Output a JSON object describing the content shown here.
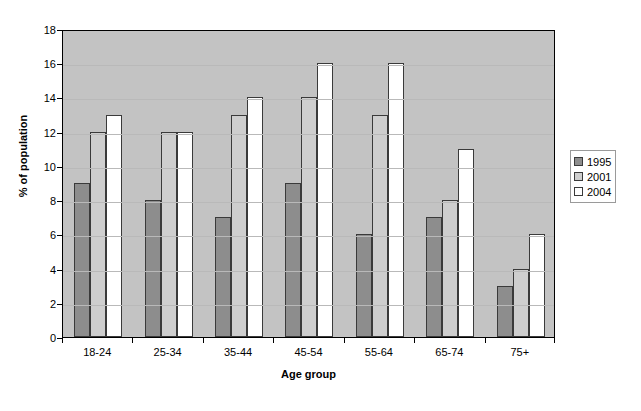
{
  "chart_data": {
    "type": "bar",
    "title": "",
    "xlabel": "Age group",
    "ylabel": "% of population",
    "categories": [
      "18-24",
      "25-34",
      "35-44",
      "45-54",
      "55-64",
      "65-74",
      "75+"
    ],
    "series": [
      {
        "name": "1995",
        "color": "#8d8d8d",
        "values": [
          9,
          8,
          7,
          9,
          6,
          7,
          3
        ]
      },
      {
        "name": "2001",
        "color": "#cecece",
        "values": [
          12,
          12,
          13,
          14,
          13,
          8,
          4
        ]
      },
      {
        "name": "2004",
        "color": "#ffffff",
        "values": [
          13,
          12,
          14,
          16,
          16,
          11,
          6
        ]
      }
    ],
    "ylim": [
      0,
      18
    ],
    "ytick_step": 2,
    "yticks": [
      0,
      2,
      4,
      6,
      8,
      10,
      12,
      14,
      16,
      18
    ],
    "ytick_labels": [
      "0",
      "2",
      "4",
      "6",
      "8",
      "10",
      "12",
      "14",
      "16",
      "18"
    ],
    "grid": true,
    "grid_axis": "y",
    "legend_position": "right",
    "plot_background": "#c3c3c3",
    "figure_background": "#ffffff",
    "bar_edge_color": "#3a3a3a"
  },
  "legend": {
    "entries": [
      "1995",
      "2001",
      "2004"
    ]
  },
  "axes": {
    "x_title": "Age group",
    "y_title": "% of population"
  }
}
